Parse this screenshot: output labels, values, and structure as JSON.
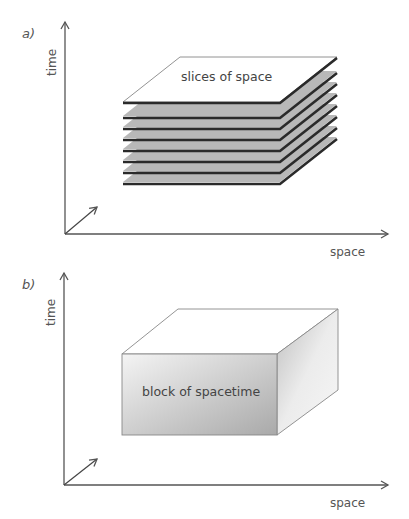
{
  "panels": [
    {
      "id": "a",
      "panel_label": "a)",
      "y_axis_label": "time",
      "x_axis_label": "space",
      "object_label": "slices of space",
      "object_type": "stack of slices",
      "slice_count": 8
    },
    {
      "id": "b",
      "panel_label": "b)",
      "y_axis_label": "time",
      "x_axis_label": "space",
      "object_label": "block of spacetime",
      "object_type": "solid block"
    }
  ],
  "colors": {
    "axis": "#555555",
    "slice_fill": "#b8b8b8",
    "slice_edge": "#2a2a2a",
    "top_face": "#ffffff",
    "block_front_light": "#f4f4f4",
    "block_front_dark": "#a9a9a9",
    "block_side_light": "#f6f6f6",
    "block_side_dark": "#bdbdbd"
  }
}
